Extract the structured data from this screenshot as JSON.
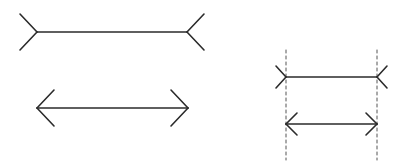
{
  "diagram": {
    "title": "Müller-Lyer illusion",
    "colors": {
      "background": "#ffffff",
      "stroke": "#2b2b2b",
      "dashed": "#555555"
    },
    "figures": [
      {
        "id": "fins-out-left",
        "type": "fins-outward",
        "x1": 37,
        "x2": 187,
        "y": 32,
        "fin_dx": 17,
        "fin_dy": 18
      },
      {
        "id": "arrows-in-left",
        "type": "arrowheads",
        "x1": 37,
        "x2": 188,
        "y": 108,
        "fin_dx": 17,
        "fin_dy": 18
      },
      {
        "id": "fins-out-right",
        "type": "fins-outward",
        "x1": 286,
        "x2": 377,
        "y": 77,
        "fin_dx": 10,
        "fin_dy": 11
      },
      {
        "id": "arrows-in-right",
        "type": "arrowheads",
        "x1": 286,
        "x2": 377,
        "y": 124,
        "fin_dx": 11,
        "fin_dy": 11
      }
    ],
    "guides": [
      {
        "id": "guide-left",
        "x": 286,
        "y1": 50,
        "y2": 160
      },
      {
        "id": "guide-right",
        "x": 377,
        "y1": 50,
        "y2": 160
      }
    ]
  }
}
